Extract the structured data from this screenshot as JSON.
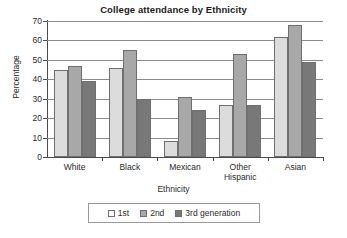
{
  "chart_data": {
    "type": "bar",
    "title": "College attendance by Ethnicity",
    "xlabel": "Ethnicity",
    "ylabel": "Percentage",
    "categories": [
      "White",
      "Black",
      "Mexican",
      "Other Hispanic",
      "Asian"
    ],
    "category_lines": [
      [
        "White"
      ],
      [
        "Black"
      ],
      [
        "Mexican"
      ],
      [
        "Other",
        "Hispanic"
      ],
      [
        "Asian"
      ]
    ],
    "series": [
      {
        "name": "1st",
        "values": [
          45,
          46,
          8,
          27,
          62
        ],
        "color": "#dcdcdc"
      },
      {
        "name": "2nd",
        "values": [
          47,
          55,
          31,
          53,
          68
        ],
        "color": "#a8a8a8"
      },
      {
        "name": "3rd generation",
        "values": [
          39,
          30,
          24,
          27,
          49
        ],
        "color": "#787878"
      }
    ],
    "ylim": [
      0,
      70
    ],
    "ytick_step": 10,
    "yticks": [
      0,
      10,
      20,
      30,
      40,
      50,
      60,
      70
    ],
    "ytick_labels": [
      "0",
      "10",
      "20",
      "30",
      "40",
      "50",
      "60",
      "70"
    ],
    "grid": true,
    "grid_axis": "y",
    "legend_position": "bottom"
  }
}
